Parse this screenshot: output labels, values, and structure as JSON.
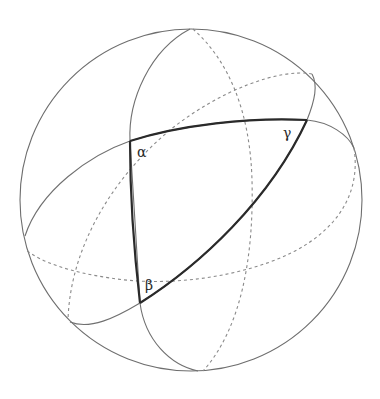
{
  "diagram": {
    "sphere": {
      "cx": 191,
      "cy": 200,
      "r": 171
    },
    "colors": {
      "outline": "#6e6e6e",
      "hidden": "#8a8a8a",
      "triangle": "#2a2a2a",
      "background": "#ffffff"
    },
    "vertices": [
      {
        "id": "alpha",
        "label": "α",
        "x": 130,
        "y": 141,
        "label_x": 137,
        "label_y": 157
      },
      {
        "id": "beta",
        "label": "β",
        "x": 140,
        "y": 303,
        "label_x": 145,
        "label_y": 290
      },
      {
        "id": "gamma",
        "label": "γ",
        "x": 307,
        "y": 120,
        "label_x": 283,
        "label_y": 138
      }
    ],
    "great_circles": [
      {
        "name": "great-circle-1",
        "front": "solid",
        "back": "dashed"
      },
      {
        "name": "great-circle-2",
        "front": "solid",
        "back": "dashed"
      },
      {
        "name": "great-circle-3",
        "front": "solid",
        "back": "dashed"
      }
    ]
  }
}
